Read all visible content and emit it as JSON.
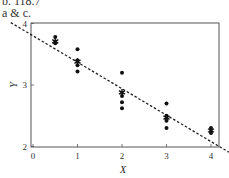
{
  "captions": {
    "line1": "b. 118.7",
    "line2": "a & c."
  },
  "chart_data": {
    "type": "scatter",
    "title": "",
    "xlabel": "X",
    "ylabel": "Y",
    "xlim": [
      0,
      4.3
    ],
    "ylim": [
      2,
      4
    ],
    "xticks": [
      "0",
      "1",
      "2",
      "3",
      "4"
    ],
    "yticks": [
      "2",
      "3",
      "4"
    ],
    "grid": false,
    "legend": null,
    "series": [
      {
        "name": "observations",
        "marker": "dot",
        "points": [
          {
            "x": 0.5,
            "y": 3.78
          },
          {
            "x": 0.5,
            "y": 3.68
          },
          {
            "x": 1,
            "y": 3.58
          },
          {
            "x": 1,
            "y": 3.4
          },
          {
            "x": 1,
            "y": 3.32
          },
          {
            "x": 1,
            "y": 3.22
          },
          {
            "x": 2,
            "y": 3.2
          },
          {
            "x": 2,
            "y": 2.82
          },
          {
            "x": 2,
            "y": 2.72
          },
          {
            "x": 2,
            "y": 2.62
          },
          {
            "x": 3,
            "y": 2.7
          },
          {
            "x": 3,
            "y": 2.5
          },
          {
            "x": 3,
            "y": 2.42
          },
          {
            "x": 3,
            "y": 2.3
          },
          {
            "x": 4,
            "y": 2.3
          },
          {
            "x": 4,
            "y": 2.22
          }
        ]
      },
      {
        "name": "group means",
        "marker": "star",
        "points": [
          {
            "x": 0.5,
            "y": 3.71
          },
          {
            "x": 1,
            "y": 3.38
          },
          {
            "x": 2,
            "y": 2.88
          },
          {
            "x": 3,
            "y": 2.47
          },
          {
            "x": 4,
            "y": 2.26
          }
        ]
      },
      {
        "name": "regression line",
        "style": "dashed",
        "intercept": 3.8,
        "slope": -0.43,
        "x_range": [
          -0.5,
          4.4
        ]
      }
    ]
  }
}
